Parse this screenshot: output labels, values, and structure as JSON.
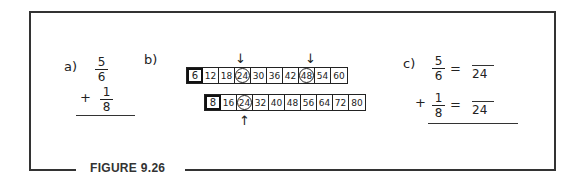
{
  "figure": {
    "caption": "FIGURE 9.26"
  },
  "part_a": {
    "label": "a)",
    "fraction1": {
      "numerator": "5",
      "denominator": "6"
    },
    "operator": "+",
    "fraction2": {
      "numerator": "1",
      "denominator": "8"
    }
  },
  "part_b": {
    "label": "b)",
    "row1": {
      "values": [
        "6",
        "12",
        "18",
        "24",
        "30",
        "36",
        "42",
        "48",
        "54",
        "60"
      ],
      "circled": [
        "24",
        "48"
      ],
      "arrows_above": [
        "24",
        "48"
      ]
    },
    "row2": {
      "values": [
        "8",
        "16",
        "24",
        "32",
        "40",
        "48",
        "56",
        "64",
        "72",
        "80"
      ],
      "circled": [
        "24"
      ],
      "arrows_below": [
        "24"
      ]
    },
    "arrow_down": "↓",
    "arrow_up": "↑"
  },
  "part_c": {
    "label": "c)",
    "line1": {
      "numerator": "5",
      "denominator": "6",
      "equals": "=",
      "result_denominator": "24"
    },
    "operator": "+",
    "line2": {
      "numerator": "1",
      "denominator": "8",
      "equals": "=",
      "result_denominator": "24"
    }
  }
}
